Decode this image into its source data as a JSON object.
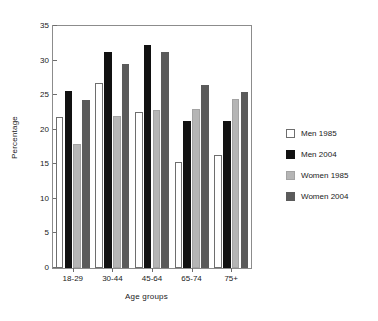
{
  "chart_data": {
    "type": "bar",
    "title": "",
    "xlabel": "Age groups",
    "ylabel": "Percentage",
    "categories": [
      "18-29",
      "30-44",
      "45-64",
      "65-74",
      "75+"
    ],
    "series": [
      {
        "name": "Men 1985",
        "color": "#ffffff",
        "values": [
          21.8,
          26.7,
          22.5,
          15.4,
          16.4
        ]
      },
      {
        "name": "Men 2004",
        "color": "#111111",
        "values": [
          25.6,
          31.3,
          32.3,
          21.3,
          21.3
        ]
      },
      {
        "name": "Women 1985",
        "color": "#b5b5b5",
        "values": [
          18.0,
          22.0,
          22.8,
          23.0,
          24.4
        ]
      },
      {
        "name": "Women 2004",
        "color": "#5b5b5b",
        "values": [
          24.3,
          29.5,
          31.2,
          26.5,
          25.5
        ]
      }
    ],
    "ylim": [
      0,
      35
    ],
    "yticks": [
      0,
      5,
      10,
      15,
      20,
      25,
      30,
      35
    ],
    "ytick_labels": [
      "0",
      "5",
      "10",
      "15",
      "20",
      "25",
      "30",
      "35"
    ],
    "grid": false,
    "legend_position": "right"
  },
  "legend": {
    "entries": [
      {
        "label": "Men 1985"
      },
      {
        "label": "Men 2004"
      },
      {
        "label": "Women 1985"
      },
      {
        "label": "Women 2004"
      }
    ]
  }
}
